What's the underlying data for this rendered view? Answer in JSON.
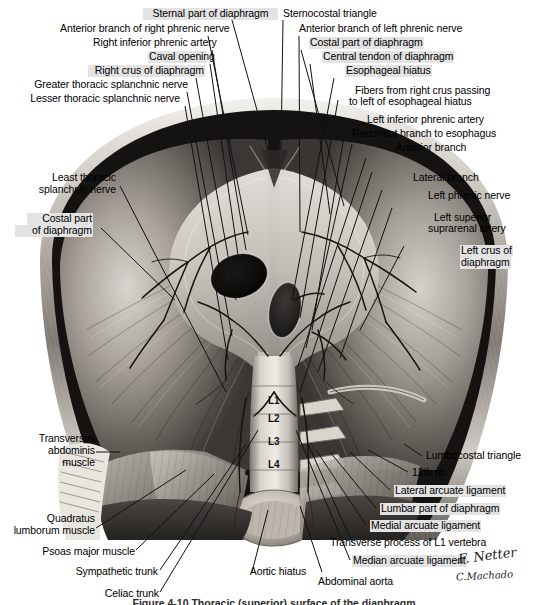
{
  "plate": {
    "title": "Diaphragm — abdominal (inferior) surface",
    "background_color": "#ffffff",
    "label_highlight_color": "#e3e3e3",
    "text_color": "#000000",
    "leader_line_color": "#111111"
  },
  "labels_left": [
    {
      "id": "anterior-branch-right-phrenic-nerve",
      "text": "Anterior branch of right phrenic nerve",
      "highlight": false
    },
    {
      "id": "right-inferior-phrenic-artery",
      "text": "Right inferior phrenic artery",
      "highlight": false
    },
    {
      "id": "caval-opening",
      "text": "Caval opening",
      "highlight": true
    },
    {
      "id": "right-crus-of-diaphragm",
      "text": "Right crus of diaphragm",
      "highlight": true
    },
    {
      "id": "greater-thoracic-splanchnic-nerve",
      "text": "Greater thoracic splanchnic nerve",
      "highlight": false
    },
    {
      "id": "lesser-thoracic-splanchnic-nerve",
      "text": "Lesser thoracic splanchnic nerve",
      "highlight": false
    },
    {
      "id": "least-thoracic-splanchnic-nerve-1",
      "text": "Least thoracic",
      "highlight": false
    },
    {
      "id": "least-thoracic-splanchnic-nerve-2",
      "text": "splanchnic nerve",
      "highlight": false
    },
    {
      "id": "costal-part-of-diaphragm-left-1",
      "text": "Costal part",
      "highlight": true
    },
    {
      "id": "costal-part-of-diaphragm-left-2",
      "text": "of diaphragm",
      "highlight": true
    }
  ],
  "labels_top_center": [
    {
      "id": "sternal-part-of-diaphragm",
      "text": "Sternal part of diaphragm",
      "highlight": true
    },
    {
      "id": "sternocostal-triangle",
      "text": "Sternocostal triangle",
      "highlight": false
    }
  ],
  "labels_right": [
    {
      "id": "anterior-branch-left-phrenic-nerve",
      "text": "Anterior branch of left phrenic nerve",
      "highlight": false
    },
    {
      "id": "costal-part-of-diaphragm",
      "text": "Costal part of diaphragm",
      "highlight": true
    },
    {
      "id": "central-tendon-of-diaphragm",
      "text": "Central tendon of diaphragm",
      "highlight": true
    },
    {
      "id": "esophageal-hiatus",
      "text": "Esophageal hiatus",
      "highlight": true
    },
    {
      "id": "fibers-right-crus-1",
      "text": "Fibers from right crus passing",
      "highlight": false
    },
    {
      "id": "fibers-right-crus-2",
      "text": "to left of esophageal hiatus",
      "highlight": false
    },
    {
      "id": "left-inferior-phrenic-artery",
      "text": "Left inferior phrenic artery",
      "highlight": false
    },
    {
      "id": "recurrent-branch-to-esophagus",
      "text": "Recurrent branch to esophagus",
      "highlight": false
    },
    {
      "id": "anterior-branch",
      "text": "Anterior branch",
      "highlight": false
    },
    {
      "id": "lateral-branch",
      "text": "Lateral branch",
      "highlight": false
    },
    {
      "id": "left-phrenic-nerve",
      "text": "Left phrenic nerve",
      "highlight": false
    },
    {
      "id": "left-superior-suprarenal-artery-1",
      "text": "Left superior",
      "highlight": false
    },
    {
      "id": "left-superior-suprarenal-artery-2",
      "text": "suprarenal artery",
      "highlight": false
    },
    {
      "id": "left-crus-of-diaphragm-1",
      "text": "Left crus of",
      "highlight": true
    },
    {
      "id": "left-crus-of-diaphragm-2",
      "text": "diaphragm",
      "highlight": true
    }
  ],
  "labels_lower_left": [
    {
      "id": "transversus-abdominis-muscle-1",
      "text": "Transversus",
      "highlight": false
    },
    {
      "id": "transversus-abdominis-muscle-2",
      "text": "abdominis",
      "highlight": false
    },
    {
      "id": "transversus-abdominis-muscle-3",
      "text": "muscle",
      "highlight": false
    },
    {
      "id": "quadratus-lumborum-muscle-1",
      "text": "Quadratus",
      "highlight": false
    },
    {
      "id": "quadratus-lumborum-muscle-2",
      "text": "lumborum muscle",
      "highlight": false
    },
    {
      "id": "psoas-major-muscle",
      "text": "Psoas major muscle",
      "highlight": false
    },
    {
      "id": "sympathetic-trunk",
      "text": "Sympathetic trunk",
      "highlight": false
    },
    {
      "id": "celiac-trunk",
      "text": "Celiac trunk",
      "highlight": false
    }
  ],
  "labels_lower_center": [
    {
      "id": "aortic-hiatus",
      "text": "Aortic hiatus",
      "highlight": false
    }
  ],
  "labels_lower_right": [
    {
      "id": "lumbocostal-triangle",
      "text": "Lumbocostal triangle",
      "highlight": false
    },
    {
      "id": "12th-rib",
      "text": "12th rib",
      "highlight": false
    },
    {
      "id": "lateral-arcuate-ligament",
      "text": "Lateral arcuate ligament",
      "highlight": true
    },
    {
      "id": "lumbar-part-of-diaphragm",
      "text": "Lumbar part of diaphragm",
      "highlight": true
    },
    {
      "id": "medial-arcuate-ligament",
      "text": "Medial arcuate ligament",
      "highlight": true
    },
    {
      "id": "transverse-process-of-l1-vertebra",
      "text": "Transverse process of L1 vertebra",
      "highlight": false
    },
    {
      "id": "median-arcuate-ligament",
      "text": "Median arcuate ligament",
      "highlight": true
    },
    {
      "id": "abdominal-aorta",
      "text": "Abdominal aorta",
      "highlight": false
    }
  ],
  "vertebrae": [
    {
      "id": "l1",
      "text": "L1"
    },
    {
      "id": "l2",
      "text": "L2"
    },
    {
      "id": "l3",
      "text": "L3"
    },
    {
      "id": "l4",
      "text": "L4"
    }
  ],
  "signatures": {
    "netter": "F. Netter",
    "machado": "C.Machado"
  },
  "caption": {
    "text": "Figure 4-10  Thoracic (superior) surface of the diaphragm"
  }
}
